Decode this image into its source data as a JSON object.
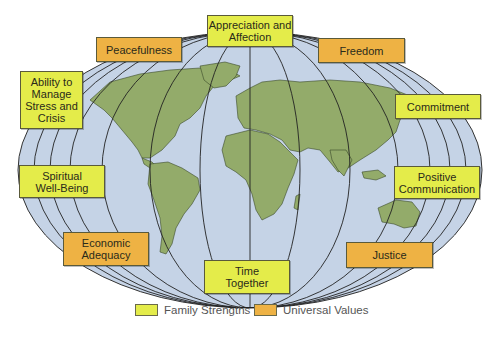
{
  "diagram": {
    "type": "world-map-with-labels",
    "colors": {
      "family_strengths": "#e4ec4a",
      "universal_values": "#eeb244",
      "ocean": "#c5d3e6",
      "land": "#93ab6a",
      "lines": "#222222"
    },
    "labels": {
      "appreciation": "Appreciation and Affection",
      "peacefulness": "Peacefulness",
      "freedom": "Freedom",
      "stress": "Ability to Manage Stress and Crisis",
      "commitment": "Commitment",
      "spiritual": "Spiritual Well-Being",
      "communication": "Positive Communication",
      "economic": "Economic Adequacy",
      "justice": "Justice",
      "time": "Time Together"
    },
    "categories": {
      "family_strengths": [
        "Appreciation and Affection",
        "Ability to Manage Stress and Crisis",
        "Commitment",
        "Spiritual Well-Being",
        "Positive Communication",
        "Time Together"
      ],
      "universal_values": [
        "Peacefulness",
        "Freedom",
        "Economic Adequacy",
        "Justice"
      ]
    }
  },
  "legend": {
    "family_strengths": "Family Strengths",
    "universal_values": "Universal Values"
  }
}
